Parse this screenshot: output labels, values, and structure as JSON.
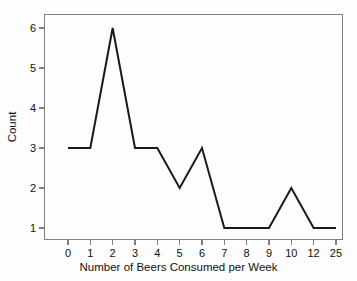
{
  "chart_data": {
    "type": "line",
    "title": "",
    "xlabel": "Number of Beers Consumed per Week",
    "ylabel": "Count",
    "categories": [
      "0",
      "1",
      "2",
      "3",
      "4",
      "5",
      "6",
      "7",
      "8",
      "9",
      "10",
      "12",
      "25"
    ],
    "values": [
      3,
      3,
      6,
      3,
      3,
      2,
      3,
      1,
      1,
      1,
      2,
      1,
      1
    ],
    "xticks": [
      "0",
      "1",
      "2",
      "3",
      "4",
      "5",
      "6",
      "7",
      "8",
      "9",
      "10",
      "12",
      "25"
    ],
    "yticks": [
      "1",
      "2",
      "3",
      "4",
      "5",
      "6"
    ],
    "ylim": [
      0.65,
      6.3
    ],
    "grid": false,
    "legend": null,
    "line_color": "#1a1a1a",
    "frame_color": "#7f7f7f",
    "background_color": "#fdfdfd"
  }
}
